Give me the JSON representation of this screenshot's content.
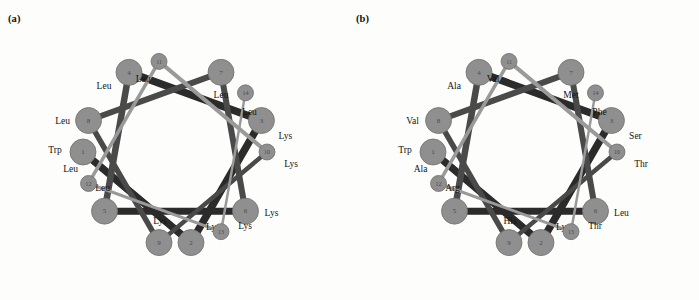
{
  "figure": {
    "type": "helical-wheel-diagram",
    "background_color": "#fdfdfb",
    "node_fill": "#8f8f8f",
    "node_stroke": "#6e6e6e",
    "edge_dark": "#2b2b2b",
    "edge_mid": "#4a4a4a",
    "edge_light": "#9a9a9a",
    "big_node_radius": 13,
    "small_node_radius": 8,
    "wheel_radius": 92,
    "degrees_per_residue": 100
  },
  "panels": [
    {
      "id": "a",
      "label": "(a)",
      "center": {
        "x": 175,
        "y": 152
      },
      "nodes": [
        {
          "num": "1",
          "residue": "Trp",
          "angle": 180,
          "size": "big",
          "label_dx": -28,
          "label_dy": -2
        },
        {
          "num": "2",
          "residue": "Lys",
          "angle": 280,
          "size": "big",
          "label_dx": 22,
          "label_dy": -16
        },
        {
          "num": "3",
          "residue": "Lys",
          "angle": 20,
          "size": "big",
          "label_dx": 24,
          "label_dy": 15
        },
        {
          "num": "4",
          "residue": "Leu",
          "angle": 120,
          "size": "big",
          "label_dx": -25,
          "label_dy": 14
        },
        {
          "num": "5",
          "residue": "Leu",
          "angle": 220,
          "size": "big",
          "label_dx": -2,
          "label_dy": -23
        },
        {
          "num": "6",
          "residue": "Lys",
          "angle": 320,
          "size": "big",
          "label_dx": 26,
          "label_dy": 2
        },
        {
          "num": "7",
          "residue": "Leu",
          "angle": 60,
          "size": "big",
          "label_dx": 0,
          "label_dy": 23
        },
        {
          "num": "8",
          "residue": "Leu",
          "angle": 160,
          "size": "big",
          "label_dx": -26,
          "label_dy": 0
        },
        {
          "num": "9",
          "residue": "Lys",
          "angle": 260,
          "size": "big",
          "label_dx": 1,
          "label_dy": -22
        },
        {
          "num": "10",
          "residue": "Lys",
          "angle": 0,
          "size": "small",
          "label_dx": 24,
          "label_dy": 12
        },
        {
          "num": "11",
          "residue": "Leu",
          "angle": 100,
          "size": "small",
          "label_dx": -16,
          "label_dy": 18
        },
        {
          "num": "12",
          "residue": "Leu",
          "angle": 200,
          "size": "small",
          "label_dx": -18,
          "label_dy": -14
        },
        {
          "num": "13",
          "residue": "Lys",
          "angle": 300,
          "size": "small",
          "label_dx": 24,
          "label_dy": -6
        },
        {
          "num": "14",
          "residue": "Leu",
          "angle": 40,
          "size": "small",
          "label_dx": 4,
          "label_dy": 19
        }
      ]
    },
    {
      "id": "b",
      "label": "(b)",
      "center": {
        "x": 175,
        "y": 152
      },
      "nodes": [
        {
          "num": "1",
          "residue": "Trp",
          "angle": 180,
          "size": "big",
          "label_dx": -28,
          "label_dy": -2
        },
        {
          "num": "2",
          "residue": "Lys",
          "angle": 280,
          "size": "big",
          "label_dx": 22,
          "label_dy": -16
        },
        {
          "num": "3",
          "residue": "Ser",
          "angle": 20,
          "size": "big",
          "label_dx": 24,
          "label_dy": 15
        },
        {
          "num": "4",
          "residue": "Ala",
          "angle": 120,
          "size": "big",
          "label_dx": -25,
          "label_dy": 14
        },
        {
          "num": "5",
          "residue": "Arg",
          "angle": 220,
          "size": "big",
          "label_dx": -2,
          "label_dy": -23
        },
        {
          "num": "6",
          "residue": "Leu",
          "angle": 320,
          "size": "big",
          "label_dx": 26,
          "label_dy": 2
        },
        {
          "num": "7",
          "residue": "Met",
          "angle": 60,
          "size": "big",
          "label_dx": 0,
          "label_dy": 23
        },
        {
          "num": "8",
          "residue": "Val",
          "angle": 160,
          "size": "big",
          "label_dx": -26,
          "label_dy": 0
        },
        {
          "num": "9",
          "residue": "His",
          "angle": 260,
          "size": "big",
          "label_dx": 1,
          "label_dy": -22
        },
        {
          "num": "10",
          "residue": "Thr",
          "angle": 0,
          "size": "small",
          "label_dx": 24,
          "label_dy": 12
        },
        {
          "num": "11",
          "residue": "Val",
          "angle": 100,
          "size": "small",
          "label_dx": -16,
          "label_dy": 18
        },
        {
          "num": "12",
          "residue": "Ala",
          "angle": 200,
          "size": "small",
          "label_dx": -18,
          "label_dy": -14
        },
        {
          "num": "13",
          "residue": "Thr",
          "angle": 300,
          "size": "small",
          "label_dx": 24,
          "label_dy": -6
        },
        {
          "num": "14",
          "residue": "Phe",
          "angle": 40,
          "size": "small",
          "label_dx": 4,
          "label_dy": 19
        }
      ]
    }
  ],
  "edges": [
    {
      "from": "1",
      "to": "2",
      "weight": 7.5,
      "shade": "edge_dark"
    },
    {
      "from": "2",
      "to": "3",
      "weight": 7.5,
      "shade": "edge_dark"
    },
    {
      "from": "3",
      "to": "4",
      "weight": 7.5,
      "shade": "edge_dark"
    },
    {
      "from": "4",
      "to": "5",
      "weight": 6.5,
      "shade": "edge_mid"
    },
    {
      "from": "5",
      "to": "6",
      "weight": 7.0,
      "shade": "edge_dark"
    },
    {
      "from": "6",
      "to": "7",
      "weight": 6.0,
      "shade": "edge_mid"
    },
    {
      "from": "7",
      "to": "8",
      "weight": 6.0,
      "shade": "edge_mid"
    },
    {
      "from": "8",
      "to": "9",
      "weight": 5.5,
      "shade": "edge_mid"
    },
    {
      "from": "9",
      "to": "10",
      "weight": 4.5,
      "shade": "edge_mid"
    },
    {
      "from": "10",
      "to": "11",
      "weight": 4.0,
      "shade": "edge_light"
    },
    {
      "from": "11",
      "to": "12",
      "weight": 3.5,
      "shade": "edge_light"
    },
    {
      "from": "12",
      "to": "13",
      "weight": 3.0,
      "shade": "edge_light"
    },
    {
      "from": "13",
      "to": "14",
      "weight": 2.5,
      "shade": "edge_light"
    }
  ]
}
